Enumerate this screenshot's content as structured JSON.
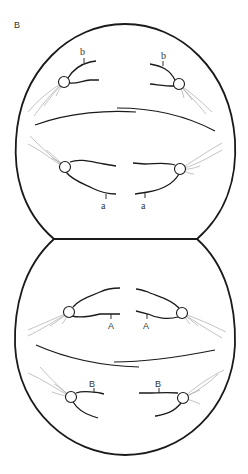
{
  "figure": {
    "panel_label": "B",
    "upper_cell": {
      "top_labels": [
        "b",
        "b"
      ],
      "bottom_labels": [
        "a",
        "a"
      ]
    },
    "lower_cell": {
      "top_labels": [
        "A",
        "A"
      ],
      "bottom_labels": [
        "B",
        "B"
      ]
    },
    "colors": {
      "outline": "#1a1a1a",
      "fibers": "#9a9a9a",
      "text": "#333333"
    }
  }
}
